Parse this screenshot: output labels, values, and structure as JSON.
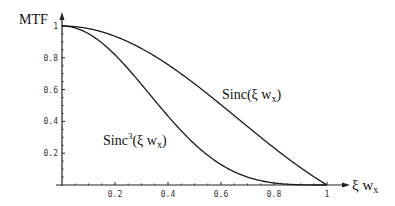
{
  "chart_data": {
    "type": "line",
    "title": "",
    "xlabel": "ξ w_x",
    "ylabel": "MTF",
    "xlim": [
      0,
      1
    ],
    "ylim": [
      0,
      1
    ],
    "grid": false,
    "legend": "inline annotations",
    "x_ticks": [
      "0.2",
      "0.4",
      "0.6",
      "0.8",
      "1"
    ],
    "y_ticks": [
      "0.2",
      "0.4",
      "0.6",
      "0.8",
      "1"
    ],
    "series": [
      {
        "name": "Sinc(ξ w_x)",
        "label_main": "Sinc(ξ w",
        "label_sub": "x",
        "label_sup": "",
        "label_close": ")",
        "x": [
          0,
          0.1,
          0.2,
          0.3,
          0.4,
          0.5,
          0.6,
          0.7,
          0.8,
          0.9,
          1.0
        ],
        "values": [
          1.0,
          0.984,
          0.935,
          0.858,
          0.757,
          0.637,
          0.505,
          0.368,
          0.234,
          0.109,
          0.0
        ]
      },
      {
        "name": "Sinc^3(ξ w_x)",
        "label_main": "Sinc",
        "label_sup": "3",
        "label_mid": "(ξ w",
        "label_sub": "x",
        "label_close": ")",
        "x": [
          0,
          0.1,
          0.2,
          0.3,
          0.4,
          0.5,
          0.6,
          0.7,
          0.8,
          0.9,
          1.0
        ],
        "values": [
          1.0,
          0.952,
          0.818,
          0.632,
          0.434,
          0.258,
          0.129,
          0.05,
          0.013,
          0.001,
          0.0
        ]
      }
    ]
  },
  "axes": {
    "y_title": "MTF",
    "x_title_main": "ξ w",
    "x_title_sub": "x"
  }
}
